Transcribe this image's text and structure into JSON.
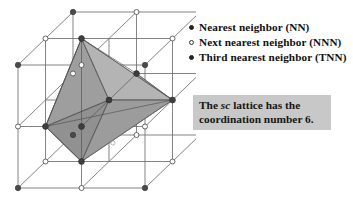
{
  "figure": {
    "name": "simple-cubic-lattice-coordination-diagram",
    "colors": {
      "background": "#ffffff",
      "lattice_line": "#6e6e6e",
      "node_filled": "#4a4a4a",
      "node_hollow_fill": "#ffffff",
      "node_hollow_stroke": "#5a5a5a",
      "octahedron_light": "#b4b4b4",
      "octahedron_mid": "#9c9c9c",
      "octahedron_dark": "#8b8b8b",
      "octahedron_edge": "#6a6a6a",
      "caption_box_bg": "#c8c8c8",
      "text": "#111111"
    }
  },
  "lattice": {
    "description": "2x2x2 simple cubic lattice drawn in oblique projection with an inscribed octahedron",
    "cells_per_edge": 2,
    "points_per_edge": 3,
    "total_points": 27,
    "projection": {
      "origin_x": 18,
      "origin_y": 188,
      "axis_x": [
        63.5,
        0
      ],
      "axis_y": [
        0,
        -61.5
      ],
      "axis_z": [
        27.5,
        -26.5
      ]
    },
    "node_types": {
      "corner": "third-nearest-neighbor",
      "edge_midpoint": "next-nearest-neighbor",
      "face_center": "nearest-neighbor",
      "body_center": "reference-atom"
    },
    "octahedron_vertices": [
      "face-center-left",
      "face-center-right",
      "face-center-top",
      "face-center-bottom",
      "face-center-front",
      "face-center-back"
    ]
  },
  "legend": {
    "items": [
      {
        "marker": "filled-dot-icon",
        "marker_style": "filled",
        "label": "Nearest neighbor (NN)"
      },
      {
        "marker": "hollow-dot-icon",
        "marker_style": "hollow",
        "label": "Next nearest neighbor (NNN)"
      },
      {
        "marker": "filled-dot-icon",
        "marker_style": "filled",
        "label": "Third nearest neighbor (TNN)"
      }
    ]
  },
  "caption": {
    "line1_prefix": "The ",
    "line1_emphasis": "sc",
    "line1_suffix": " lattice has the",
    "line2": "coordination number 6."
  }
}
